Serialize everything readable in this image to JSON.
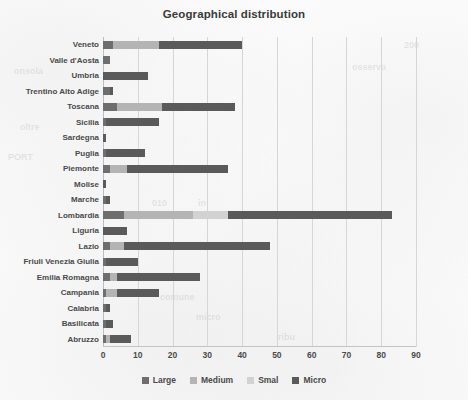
{
  "chart_data": {
    "type": "bar",
    "orientation": "horizontal",
    "stacked": true,
    "title": "Geographical distribution",
    "xlabel": "",
    "ylabel": "",
    "xlim": [
      0,
      90
    ],
    "xticks": [
      0,
      10,
      20,
      30,
      40,
      50,
      60,
      70,
      80,
      90
    ],
    "grid": true,
    "legend_position": "bottom",
    "categories": [
      "Veneto",
      "Valle d'Aosta",
      "Umbria",
      "Trentino Alto Adige",
      "Toscana",
      "Sicilia",
      "Sardegna",
      "Puglia",
      "Piemonte",
      "Molise",
      "Marche",
      "Lombardia",
      "Liguria",
      "Lazio",
      "Friuli Venezia Giulia",
      "Emilia Romagna",
      "Campania",
      "Calabria",
      "Basilicata",
      "Abruzzo"
    ],
    "series": [
      {
        "name": "Large",
        "color": "#6e6e6e",
        "values": [
          3,
          2,
          0,
          2,
          4,
          1,
          0,
          1,
          2,
          0,
          1,
          6,
          0,
          2,
          1,
          2,
          1,
          1,
          1,
          1
        ]
      },
      {
        "name": "Medium",
        "color": "#b4b4b4",
        "values": [
          13,
          0,
          0,
          0,
          13,
          0,
          0,
          0,
          5,
          0,
          0,
          20,
          0,
          4,
          0,
          2,
          3,
          0,
          0,
          1
        ]
      },
      {
        "name": "Smal",
        "color": "#d2d2d2",
        "values": [
          0,
          0,
          0,
          0,
          0,
          0,
          0,
          0,
          0,
          0,
          0,
          10,
          0,
          0,
          0,
          0,
          0,
          0,
          0,
          0
        ]
      },
      {
        "name": "Micro",
        "color": "#5a5a5a",
        "values": [
          24,
          0,
          13,
          1,
          21,
          15,
          1,
          11,
          29,
          1,
          1,
          47,
          7,
          42,
          9,
          24,
          12,
          1,
          2,
          6
        ]
      }
    ]
  },
  "legend": {
    "items": [
      {
        "label": "Large",
        "color": "#6e6e6e"
      },
      {
        "label": "Medium",
        "color": "#b4b4b4"
      },
      {
        "label": "Smal",
        "color": "#d2d2d2"
      },
      {
        "label": "Micro",
        "color": "#5a5a5a"
      }
    ]
  },
  "ghost_marks": [
    {
      "text": "onsola",
      "x": 14,
      "y": 66,
      "rotate": 0,
      "size": 9
    },
    {
      "text": "oltre",
      "x": 20,
      "y": 122,
      "rotate": 0,
      "size": 9
    },
    {
      "text": "PORT",
      "x": 8,
      "y": 152,
      "rotate": 0,
      "size": 9
    },
    {
      "text": "osserva",
      "x": 352,
      "y": 62,
      "rotate": 0,
      "size": 9
    },
    {
      "text": "200",
      "x": 404,
      "y": 40,
      "rotate": 0,
      "size": 9
    },
    {
      "text": "comune",
      "x": 160,
      "y": 292,
      "rotate": 0,
      "size": 9
    },
    {
      "text": "micro",
      "x": 196,
      "y": 312,
      "rotate": 0,
      "size": 9
    },
    {
      "text": "ribu",
      "x": 278,
      "y": 332,
      "rotate": 0,
      "size": 9
    },
    {
      "text": "010",
      "x": 152,
      "y": 198,
      "rotate": 0,
      "size": 9
    },
    {
      "text": "in",
      "x": 198,
      "y": 198,
      "rotate": 0,
      "size": 9
    }
  ]
}
